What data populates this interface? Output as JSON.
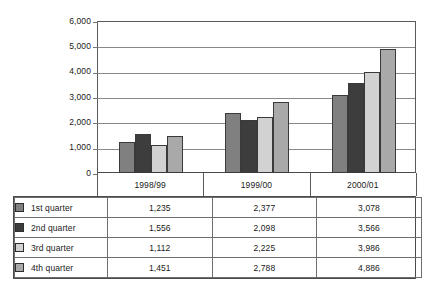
{
  "chart_data": {
    "type": "bar",
    "title": "",
    "subtitle": "",
    "xlabel": "",
    "ylabel": "",
    "categories": [
      "1998/99",
      "1999/00",
      "2000/01"
    ],
    "series": [
      {
        "name": "1st quarter",
        "values": [
          1235,
          2377,
          3078
        ],
        "color": "#808080",
        "labels": [
          "1,235",
          "2,377",
          "3,078"
        ]
      },
      {
        "name": "2nd quarter",
        "values": [
          1556,
          2098,
          3566
        ],
        "color": "#3d3d3d",
        "labels": [
          "1,556",
          "2,098",
          "3,566"
        ]
      },
      {
        "name": "3rd quarter",
        "values": [
          1112,
          2225,
          3986
        ],
        "color": "#d2d2d2",
        "labels": [
          "1,112",
          "2,225",
          "3,986"
        ]
      },
      {
        "name": "4th quarter",
        "values": [
          1451,
          2788,
          4886
        ],
        "color": "#a9a9a9",
        "labels": [
          "1,451",
          "2,788",
          "4,886"
        ]
      }
    ],
    "ylim": [
      0,
      6000
    ],
    "ytick_values": [
      6000,
      5000,
      4000,
      3000,
      2000,
      1000,
      0
    ],
    "ytick_labels": [
      "6,000",
      "5,000",
      "4,000",
      "3,000",
      "2,000",
      "1,000",
      "0"
    ],
    "grid": true,
    "grid_axis": "y",
    "legend_position": "table-below",
    "legend_entries": [
      "1st quarter",
      "2nd quarter",
      "3rd quarter",
      "4th quarter"
    ]
  },
  "table": {
    "column_headers": [
      "1998/99",
      "1999/00",
      "2000/01"
    ],
    "rows": [
      {
        "label": "1st quarter",
        "swatch_color": "#808080",
        "values": [
          "1,235",
          "2,377",
          "3,078"
        ]
      },
      {
        "label": "2nd quarter",
        "swatch_color": "#3d3d3d",
        "values": [
          "1,556",
          "2,098",
          "3,566"
        ]
      },
      {
        "label": "3rd quarter",
        "swatch_color": "#d2d2d2",
        "values": [
          "1,112",
          "2,225",
          "3,986"
        ]
      },
      {
        "label": "4th quarter",
        "swatch_color": "#a9a9a9",
        "values": [
          "1,451",
          "2,788",
          "4,886"
        ]
      }
    ]
  },
  "colors": {
    "axis": "#5a5a5a",
    "grid": "#888888",
    "bar_border": "#3a3a3a",
    "text": "#1a1a1a",
    "background": "#ffffff"
  }
}
